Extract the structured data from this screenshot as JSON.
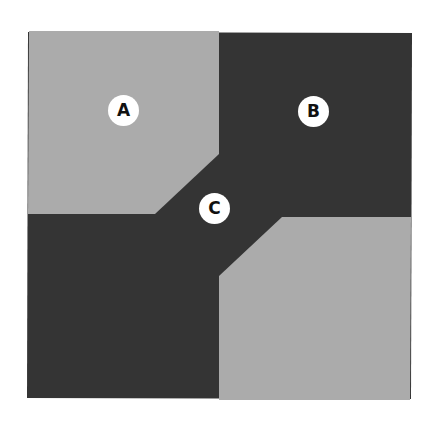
{
  "diagram": {
    "colors": {
      "background": "#ffffff",
      "light_region": "#ababab",
      "dark_region": "#343434",
      "label_fill": "#ffffff",
      "label_text": "#111111"
    },
    "regions": [
      {
        "id": "top-left-light",
        "shade": "light"
      },
      {
        "id": "top-right-dark",
        "shade": "dark"
      },
      {
        "id": "bottom-left-dark",
        "shade": "dark"
      },
      {
        "id": "bottom-right-light",
        "shade": "light"
      },
      {
        "id": "center-channel-dark",
        "shade": "dark"
      }
    ],
    "labels": [
      {
        "id": "A",
        "text": "A",
        "region": "top-left-light",
        "cx": 124,
        "cy": 111
      },
      {
        "id": "B",
        "text": "B",
        "region": "top-right-dark",
        "cx": 314,
        "cy": 112
      },
      {
        "id": "C",
        "text": "C",
        "region": "center-channel-dark",
        "cx": 215,
        "cy": 209
      }
    ]
  }
}
